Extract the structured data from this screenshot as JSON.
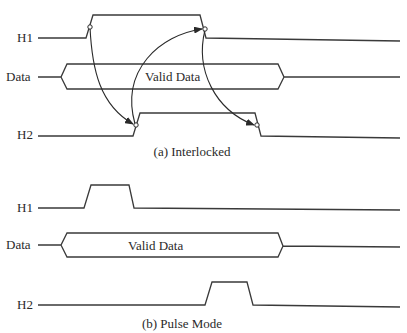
{
  "diagram": {
    "type": "timing-diagram",
    "panels": [
      {
        "id": "interlocked",
        "caption": "(a) Interlocked",
        "signals": [
          {
            "name": "H1",
            "label": "H1",
            "kind": "clock",
            "pulse": {
              "rise_x": 90,
              "fall_x": 203
            }
          },
          {
            "name": "Data",
            "label": "Data",
            "kind": "bus",
            "bus_text": "Valid Data",
            "valid_from_x": 65,
            "valid_to_x": 281
          },
          {
            "name": "H2",
            "label": "H2",
            "kind": "clock",
            "pulse": {
              "rise_x": 136,
              "fall_x": 258
            }
          }
        ],
        "handshake_arrows": [
          {
            "from": "H1 rise",
            "to": "H2 rise"
          },
          {
            "from": "H2 rise",
            "to": "H1 fall"
          },
          {
            "from": "H1 fall",
            "to": "H2 fall"
          }
        ]
      },
      {
        "id": "pulse-mode",
        "caption": "(b) Pulse Mode",
        "signals": [
          {
            "name": "H1",
            "label": "H1",
            "kind": "clock",
            "pulse": {
              "rise_x": 88,
              "fall_x": 132
            }
          },
          {
            "name": "Data",
            "label": "Data",
            "kind": "bus",
            "bus_text": "Valid Data",
            "valid_from_x": 65,
            "valid_to_x": 281
          },
          {
            "name": "H2",
            "label": "H2",
            "kind": "clock",
            "pulse": {
              "rise_x": 209,
              "fall_x": 250
            }
          }
        ]
      }
    ]
  },
  "labels": {
    "a_h1": "H1",
    "a_data": "Data",
    "a_h2": "H2",
    "a_bus": "Valid Data",
    "a_caption": "(a) Interlocked",
    "b_h1": "H1",
    "b_data": "Data",
    "b_h2": "H2",
    "b_bus": "Valid Data",
    "b_caption": "(b) Pulse Mode"
  },
  "colors": {
    "line": "#3a3a3a",
    "background": "#ffffff"
  }
}
